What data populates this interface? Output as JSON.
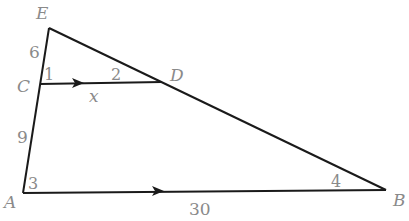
{
  "diagram": {
    "type": "triangle-with-parallel-segment",
    "vertices": {
      "E": {
        "label": "E",
        "x": 49,
        "y": 28
      },
      "C": {
        "label": "C",
        "x": 40,
        "y": 84
      },
      "D": {
        "label": "D",
        "x": 162,
        "y": 82
      },
      "A": {
        "label": "A",
        "x": 23,
        "y": 193
      },
      "B": {
        "label": "B",
        "x": 386,
        "y": 190
      }
    },
    "segment_labels": {
      "EC": "6",
      "CA": "9",
      "CD": "x",
      "AB": "30"
    },
    "angle_labels": {
      "angle1": "1",
      "angle2": "2",
      "angle3": "3",
      "angle4": "4"
    },
    "colors": {
      "line": "#1a1a1a",
      "label": "#8a8a8a"
    }
  }
}
